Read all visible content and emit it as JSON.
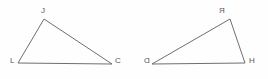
{
  "figure": {
    "background_color": "#fefefe",
    "stroke_color": "#6f6f73",
    "label_color": "#58585c",
    "width": 268,
    "height": 79
  },
  "triangles": [
    {
      "id": "left-triangle",
      "name": "triangle-JLC",
      "orientation": "apex-left-of-center",
      "points": "44,19 18,63 112,64 44,19",
      "vertices": [
        {
          "key": "apex",
          "label": "J",
          "x": 41,
          "y": 7,
          "mirrored": false
        },
        {
          "key": "bottom-left",
          "label": "L",
          "x": 10,
          "y": 57,
          "mirrored": false
        },
        {
          "key": "bottom-right",
          "label": "C",
          "x": 115,
          "y": 57,
          "mirrored": false
        }
      ]
    },
    {
      "id": "right-triangle",
      "name": "triangle-RDH",
      "orientation": "apex-right-of-center",
      "points": "230,19 152,64 245,63 230,19",
      "vertices": [
        {
          "key": "apex",
          "label": "R",
          "x": 219,
          "y": 7,
          "mirrored": true
        },
        {
          "key": "bottom-left",
          "label": "D",
          "x": 144,
          "y": 57,
          "mirrored": true
        },
        {
          "key": "bottom-right",
          "label": "H",
          "x": 249,
          "y": 57,
          "mirrored": true
        }
      ]
    }
  ]
}
